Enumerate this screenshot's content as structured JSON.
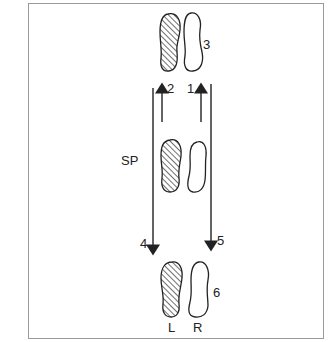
{
  "diagram": {
    "type": "footprint-step-diagram",
    "labels": {
      "step1": "1",
      "step2": "2",
      "step3": "3",
      "step4": "4",
      "step5": "5",
      "step6": "6",
      "start_position": "SP",
      "left_foot": "L",
      "right_foot": "R"
    },
    "footprints": [
      {
        "id": "top",
        "label": "3",
        "feet": [
          "left-hatched",
          "right-outline"
        ]
      },
      {
        "id": "start",
        "label": "SP",
        "feet": [
          "left-hatched",
          "right-outline"
        ]
      },
      {
        "id": "bottom",
        "label": "6",
        "feet": [
          "left-hatched",
          "right-outline"
        ]
      }
    ],
    "arrows": [
      {
        "label": "1",
        "direction": "up",
        "length": "short",
        "side": "right"
      },
      {
        "label": "2",
        "direction": "up",
        "length": "short",
        "side": "left"
      },
      {
        "label": "4",
        "direction": "down",
        "length": "long",
        "side": "left"
      },
      {
        "label": "5",
        "direction": "down",
        "length": "long",
        "side": "right"
      }
    ],
    "colors": {
      "ink": "#222222",
      "frame": "#9a9a9a",
      "background": "#ffffff"
    }
  }
}
